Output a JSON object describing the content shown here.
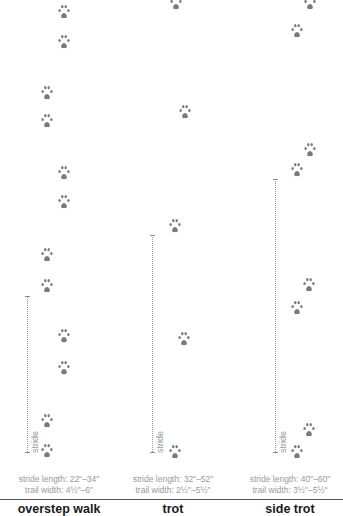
{
  "diagram": {
    "type": "animal track gait comparison",
    "colors": {
      "paw": "#7a7a7a",
      "text": "#9a9a9a",
      "title": "#1a1a1a",
      "divider": "#555555"
    },
    "stride_label": "stride",
    "gaits": [
      {
        "name": "overstep walk",
        "stride_length": "stride length: 22\"–34\"",
        "trail_width": "trail width: 4½\"–6\"",
        "paws": [
          {
            "x": 64,
            "y": 12
          },
          {
            "x": 64,
            "y": 42
          },
          {
            "x": 47,
            "y": 93
          },
          {
            "x": 47,
            "y": 121
          },
          {
            "x": 64,
            "y": 173
          },
          {
            "x": 64,
            "y": 202
          },
          {
            "x": 47,
            "y": 255
          },
          {
            "x": 47,
            "y": 286
          },
          {
            "x": 64,
            "y": 336
          },
          {
            "x": 64,
            "y": 368
          },
          {
            "x": 47,
            "y": 421
          },
          {
            "x": 47,
            "y": 451
          }
        ],
        "stride": {
          "x": 27,
          "top": 296,
          "bottom": 452
        }
      },
      {
        "name": "trot",
        "stride_length": "stride length: 32\"–52\"",
        "trail_width": "trail width: 2½\"–5½\"",
        "paws": [
          {
            "x": 176,
            "y": 3
          },
          {
            "x": 185,
            "y": 112
          },
          {
            "x": 175,
            "y": 226
          },
          {
            "x": 184,
            "y": 339
          },
          {
            "x": 175,
            "y": 452
          }
        ],
        "stride": {
          "x": 152,
          "top": 235,
          "bottom": 452
        }
      },
      {
        "name": "side trot",
        "stride_length": "stride length: 40\"–60\"",
        "trail_width": "trail width: 3½\"–5½\"",
        "paws": [
          {
            "x": 310,
            "y": 3
          },
          {
            "x": 297,
            "y": 31
          },
          {
            "x": 310,
            "y": 150
          },
          {
            "x": 297,
            "y": 170
          },
          {
            "x": 309,
            "y": 285
          },
          {
            "x": 297,
            "y": 308
          },
          {
            "x": 309,
            "y": 430
          },
          {
            "x": 297,
            "y": 452
          }
        ],
        "stride": {
          "x": 275,
          "top": 179,
          "bottom": 452
        }
      }
    ]
  }
}
